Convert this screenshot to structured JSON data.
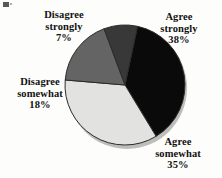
{
  "chart_data": {
    "type": "pie",
    "title": "",
    "subtitle": "",
    "xlabel": "",
    "ylabel": "",
    "legend_position": "none",
    "grid": false,
    "labels_outside": true,
    "categories": [
      "Agree strongly",
      "Agree somewhat",
      "Disagree somewhat",
      "Disagree strongly"
    ],
    "values": [
      38,
      35,
      18,
      7
    ],
    "value_unit": "%",
    "slices": [
      {
        "name": "agree-strongly",
        "label_line1": "Agree",
        "label_line2": "strongly",
        "value": 38,
        "value_text": "38%",
        "color": "#0a0a0a",
        "start_angle_deg": 12,
        "end_angle_deg": 148.8
      },
      {
        "name": "agree-somewhat",
        "label_line1": "Agree",
        "label_line2": "somewhat",
        "value": 35,
        "value_text": "35%",
        "color": "#e2e2e0",
        "start_angle_deg": 148.8,
        "end_angle_deg": 274.8
      },
      {
        "name": "disagree-somewhat",
        "label_line1": "Disagree",
        "label_line2": "somewhat",
        "value": 18,
        "value_text": "18%",
        "color": "#646464",
        "start_angle_deg": 274.8,
        "end_angle_deg": 339.6
      },
      {
        "name": "disagree-strongly",
        "label_line1": "Disagree",
        "label_line2": "strongly",
        "value": 7,
        "value_text": "7%",
        "color": "#383838",
        "start_angle_deg": 339.6,
        "end_angle_deg": 372
      }
    ],
    "geometry": {
      "center_x": 125,
      "center_y": 85,
      "radius": 60
    },
    "colors": {
      "background": "#fdfdfc",
      "outline": "#2b2b2b",
      "text": "#111111",
      "shadow": "#b9b9b5"
    }
  }
}
